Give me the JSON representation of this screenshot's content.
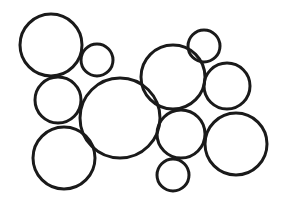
{
  "diagram": {
    "width": 288,
    "height": 207,
    "background": "#ffffff",
    "stroke_color": "#1a1a1a",
    "stroke_width": 3,
    "circles": [
      {
        "id": "a",
        "cx": 51,
        "cy": 45,
        "r": 31
      },
      {
        "id": "b",
        "cx": 97,
        "cy": 60,
        "r": 16
      },
      {
        "id": "c",
        "cx": 58,
        "cy": 100,
        "r": 23
      },
      {
        "id": "d",
        "cx": 120,
        "cy": 118,
        "r": 40
      },
      {
        "id": "e",
        "cx": 64,
        "cy": 158,
        "r": 31
      },
      {
        "id": "f",
        "cx": 204,
        "cy": 46,
        "r": 16
      },
      {
        "id": "g",
        "cx": 173,
        "cy": 77,
        "r": 32
      },
      {
        "id": "h",
        "cx": 227,
        "cy": 86,
        "r": 23
      },
      {
        "id": "i",
        "cx": 181,
        "cy": 134,
        "r": 24
      },
      {
        "id": "j",
        "cx": 236,
        "cy": 144,
        "r": 31
      },
      {
        "id": "k",
        "cx": 173,
        "cy": 175,
        "r": 16
      }
    ]
  }
}
